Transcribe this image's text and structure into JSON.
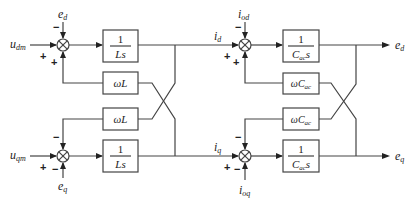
{
  "diagram": {
    "type": "block-diagram",
    "inputs": {
      "u_dm": {
        "base": "u",
        "sub": "dm"
      },
      "u_qm": {
        "base": "u",
        "sub": "qm"
      },
      "e_d_in": {
        "base": "e",
        "sub": "d"
      },
      "e_q_in": {
        "base": "e",
        "sub": "q"
      },
      "i_od": {
        "base": "i",
        "sub": "od"
      },
      "i_oq": {
        "base": "i",
        "sub": "oq"
      }
    },
    "signals": {
      "i_d": {
        "base": "i",
        "sub": "d"
      },
      "i_q": {
        "base": "i",
        "sub": "q"
      }
    },
    "outputs": {
      "e_d": {
        "base": "e",
        "sub": "d"
      },
      "e_q": {
        "base": "e",
        "sub": "q"
      }
    },
    "blocks": {
      "inductor_d": {
        "num": "1",
        "den": "Ls"
      },
      "inductor_q": {
        "num": "1",
        "den": "Ls"
      },
      "coupling_L_top": {
        "label": "ωL"
      },
      "coupling_L_bottom": {
        "label": "ωL"
      },
      "capacitor_d": {
        "num": "1",
        "den_base": "C",
        "den_sub": "ac",
        "den_tail": "s"
      },
      "capacitor_q": {
        "num": "1",
        "den_base": "C",
        "den_sub": "ac",
        "den_tail": "s"
      },
      "coupling_C_top": {
        "label_pre": "ωC",
        "label_sub": "ac"
      },
      "coupling_C_bottom": {
        "label_pre": "ωC",
        "label_sub": "ac"
      }
    },
    "summing_junctions": {
      "sj1": {
        "top": "−",
        "left": "+",
        "bottom": "+"
      },
      "sj2": {
        "top": "−",
        "left": "+",
        "bottom": "−"
      },
      "sj3": {
        "top": "−",
        "left": "+",
        "bottom": "+"
      },
      "sj4": {
        "top": "−",
        "left": "+",
        "bottom": "−"
      }
    }
  }
}
